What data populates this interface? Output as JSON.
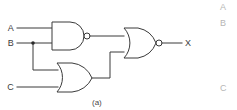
{
  "figure": {
    "caption": "(a)",
    "kind": "logic-circuit-diagram",
    "line_color": "#3a3a3a",
    "background_color": "#ffffff"
  },
  "inputs": [
    {
      "id": "A",
      "label": "A"
    },
    {
      "id": "B",
      "label": "B"
    },
    {
      "id": "C",
      "label": "C"
    }
  ],
  "outputs": [
    {
      "id": "X",
      "label": "X"
    }
  ],
  "gates": [
    {
      "id": "g1",
      "type": "NAND",
      "inputs": [
        "A",
        "B"
      ],
      "output": "n1",
      "has_bubble": true
    },
    {
      "id": "g2",
      "type": "OR",
      "inputs": [
        "B",
        "C"
      ],
      "output": "n2",
      "has_bubble": false
    },
    {
      "id": "g3",
      "type": "NOR",
      "inputs": [
        "n1",
        "n2"
      ],
      "output": "X",
      "has_bubble": true
    }
  ],
  "junctions": [
    {
      "id": "j-b",
      "on_net": "B"
    }
  ],
  "adjacent_figure_labels": [
    {
      "id": "ghost-a",
      "label": "A"
    },
    {
      "id": "ghost-b",
      "label": "B"
    },
    {
      "id": "ghost-c",
      "label": "C"
    }
  ]
}
